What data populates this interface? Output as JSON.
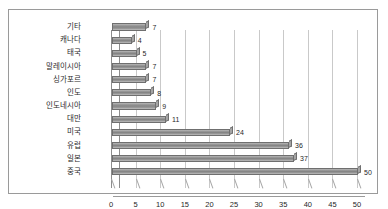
{
  "chart_data": {
    "type": "bar",
    "orientation": "horizontal",
    "title": "",
    "subtitle": "",
    "xlabel": "",
    "ylabel": "",
    "categories": [
      "기타",
      "캐나다",
      "태국",
      "말레이시아",
      "싱가포르",
      "인도",
      "인도네시아",
      "대만",
      "미국",
      "유럽",
      "일본",
      "중국"
    ],
    "values": [
      7,
      4,
      5,
      7,
      7,
      8,
      9,
      11,
      24,
      36,
      37,
      50
    ],
    "data_labels": [
      "7",
      "4",
      "5",
      "7",
      "7",
      "8",
      "9",
      "11",
      "24",
      "36",
      "37",
      "50"
    ],
    "xlim": [
      0,
      50
    ],
    "xticks": [
      0,
      5,
      10,
      15,
      20,
      25,
      30,
      35,
      40,
      45,
      50
    ],
    "xtick_labels": [
      "0",
      "5",
      "10",
      "15",
      "20",
      "25",
      "30",
      "35",
      "40",
      "45",
      "50"
    ],
    "grid": true,
    "grid_axis": "x",
    "legend": false,
    "legend_position": "none",
    "series": [
      {
        "name": "",
        "values": [
          7,
          4,
          5,
          7,
          7,
          8,
          9,
          11,
          24,
          36,
          37,
          50
        ]
      }
    ],
    "colors": {
      "bar_fill": "#8f8f8f",
      "bar_edge": "#6f6f6f",
      "gridline": "#c9c9c9",
      "axis": "#8d8d8d",
      "frame": "#9a9a9a",
      "text": "#1f1f1f",
      "background": "#ffffff"
    }
  }
}
